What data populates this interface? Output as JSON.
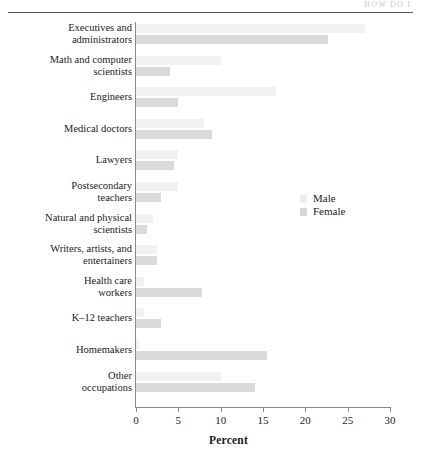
{
  "running_head": "HOW DO I",
  "chart_data": {
    "type": "bar",
    "orientation": "horizontal",
    "title": "",
    "xlabel": "Percent",
    "ylabel": "",
    "xlim": [
      0,
      30
    ],
    "xticks": [
      0,
      5,
      10,
      15,
      20,
      25,
      30
    ],
    "xtick_labels": [
      "0",
      "5",
      "10",
      "15",
      "20",
      "25",
      "30"
    ],
    "grid": false,
    "legend_position": "center-right",
    "categories": [
      "Executives and administrators",
      "Math and computer scientists",
      "Engineers",
      "Medical doctors",
      "Lawyers",
      "Postsecondary teachers",
      "Natural and physical scientists",
      "Writers, artists, and entertainers",
      "Health care workers",
      "K–12 teachers",
      "Homemakers",
      "Other occupations"
    ],
    "category_lines": [
      [
        "Executives and",
        "administrators"
      ],
      [
        "Math and computer",
        "scientists"
      ],
      [
        "Engineers"
      ],
      [
        "Medical doctors"
      ],
      [
        "Lawyers"
      ],
      [
        "Postsecondary",
        "teachers"
      ],
      [
        "Natural and physical",
        "scientists"
      ],
      [
        "Writers, artists, and",
        "entertainers"
      ],
      [
        "Health care",
        "workers"
      ],
      [
        "K–12 teachers"
      ],
      [
        "Homemakers"
      ],
      [
        "Other",
        "occupations"
      ]
    ],
    "series": [
      {
        "name": "Male",
        "color": "#f1f1f1",
        "values": [
          27.0,
          10.0,
          16.5,
          8.0,
          5.0,
          5.0,
          2.0,
          2.5,
          1.0,
          1.0,
          0.3,
          10.0
        ]
      },
      {
        "name": "Female",
        "color": "#dadada",
        "values": [
          22.7,
          4.0,
          5.0,
          9.0,
          4.5,
          3.0,
          1.3,
          2.5,
          7.8,
          3.0,
          15.5,
          14.0
        ]
      }
    ]
  },
  "legend": {
    "items": [
      {
        "label": "Male"
      },
      {
        "label": "Female"
      }
    ]
  }
}
